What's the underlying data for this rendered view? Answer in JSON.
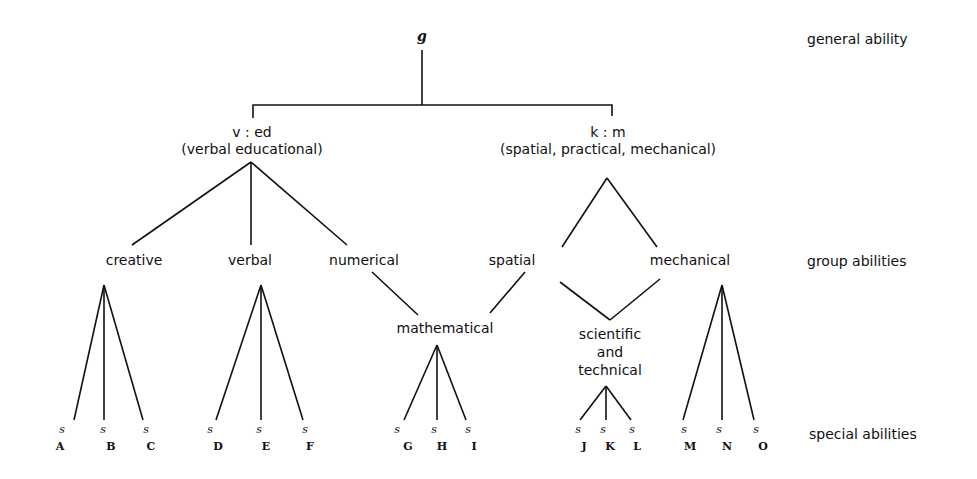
{
  "diagram": {
    "levels": {
      "general": "general ability",
      "group": "group abilities",
      "special": "special abilities"
    },
    "root": {
      "label": "g"
    },
    "major_factors": [
      {
        "id": "ved",
        "label": "v : ed",
        "sublabel": "(verbal educational)"
      },
      {
        "id": "km",
        "label": "k : m",
        "sublabel": "(spatial, practical, mechanical)"
      }
    ],
    "group_abilities": {
      "creative": "creative",
      "verbal": "verbal",
      "numerical": "numerical",
      "spatial": "spatial",
      "mechanical": "mechanical",
      "mathematical": "mathematical",
      "scientific": [
        "scientific",
        "and",
        "technical"
      ]
    },
    "special_symbol": "s",
    "special_abilities": [
      {
        "parent": "creative",
        "subs": [
          "A",
          "B",
          "C"
        ]
      },
      {
        "parent": "verbal",
        "subs": [
          "D",
          "E",
          "F"
        ]
      },
      {
        "parent": "mathematical",
        "subs": [
          "G",
          "H",
          "I"
        ]
      },
      {
        "parent": "scientific and technical",
        "subs": [
          "J",
          "K",
          "L"
        ]
      },
      {
        "parent": "mechanical",
        "subs": [
          "M",
          "N",
          "O"
        ]
      }
    ]
  }
}
